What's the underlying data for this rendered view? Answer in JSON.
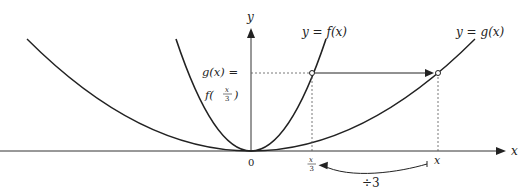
{
  "diagram": {
    "axes": {
      "x_label": "x",
      "y_label": "y",
      "origin_label": "0"
    },
    "curves": [
      {
        "name": "f",
        "label": "y = f(x)"
      },
      {
        "name": "g",
        "label": "y = g(x)"
      }
    ],
    "y_annotation": {
      "line1": "g(x) =",
      "line2_prefix": "f(",
      "frac_num": "x",
      "frac_den": "3",
      "line2_suffix": ")"
    },
    "x_ticks": {
      "left_num": "x",
      "left_den": "3",
      "right": "x"
    },
    "transform_label": "÷3",
    "colors": {
      "curve": "#222222",
      "axis": "#333333",
      "dashed": "#555555",
      "background": "#ffffff"
    }
  }
}
